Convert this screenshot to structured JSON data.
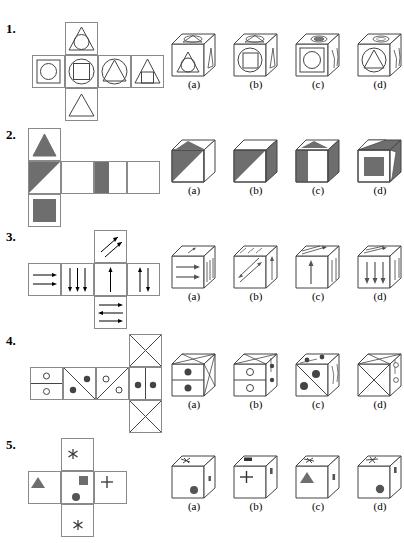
{
  "worksheet": {
    "title": "Cube Folding Spatial Reasoning Worksheet",
    "problem_count": 5
  },
  "colors": {
    "line": "#444444",
    "net_border": "#8a8a8a",
    "fill_gray": "#6e6e6e",
    "white": "#ffffff",
    "text": "#000000"
  },
  "option_labels": [
    "(a)",
    "(b)",
    "(c)",
    "(d)"
  ],
  "problems": [
    {
      "number": "1.",
      "net_description": "Cross net with a center row of four squares plus one square above and one below the second cell",
      "net_faces": [
        {
          "position": "top",
          "symbol": "triangle-with-inscribed-circle"
        },
        {
          "position": "row-1",
          "symbol": "square-with-circle"
        },
        {
          "position": "row-2",
          "symbol": "circle-with-square"
        },
        {
          "position": "row-3",
          "symbol": "circle-with-triangle"
        },
        {
          "position": "row-4",
          "symbol": "triangle-with-square"
        },
        {
          "position": "bottom",
          "symbol": "triangle-outline"
        }
      ],
      "options": [
        {
          "label": "(a)",
          "front": "triangle-with-circle"
        },
        {
          "label": "(b)",
          "front": "circle-with-square"
        },
        {
          "label": "(c)",
          "front": "square-with-circle"
        },
        {
          "label": "(d)",
          "front": "circle-with-triangle"
        }
      ]
    },
    {
      "number": "2.",
      "net_description": "Vertical strip of three squares on the left joined to a horizontal row of four squares",
      "net_faces": [
        {
          "position": "top",
          "symbol": "gray-triangle-up"
        },
        {
          "position": "row-1",
          "symbol": "gray-diagonal-lower-left"
        },
        {
          "position": "bottom",
          "symbol": "gray-square"
        },
        {
          "position": "row-2",
          "symbol": "blank"
        },
        {
          "position": "row-3",
          "symbol": "gray-vertical-band"
        },
        {
          "position": "row-4",
          "symbol": "blank"
        }
      ],
      "options": [
        {
          "label": "(a)",
          "front": "gray-diagonal-lower-left"
        },
        {
          "label": "(b)",
          "front": "gray-diagonal-upper-left"
        },
        {
          "label": "(c)",
          "front": "gray-vertical-band-left"
        },
        {
          "label": "(d)",
          "front": "gray-square-center"
        }
      ]
    },
    {
      "number": "3.",
      "net_description": "Row of four squares with one square above and one below the third cell",
      "net_faces": [
        {
          "position": "top",
          "symbol": "two-diagonal-arrows-up-right"
        },
        {
          "position": "row-1",
          "symbol": "two-arrows-right"
        },
        {
          "position": "row-2",
          "symbol": "three-arrows-down"
        },
        {
          "position": "row-3",
          "symbol": "one-arrow-up"
        },
        {
          "position": "row-4",
          "symbol": "arrow-up-and-arrow-down"
        },
        {
          "position": "bottom",
          "symbol": "three-arrows-right-left-right"
        }
      ],
      "options": [
        {
          "label": "(a)",
          "front": "two-arrows-right"
        },
        {
          "label": "(b)",
          "front": "two-diagonal-arrows"
        },
        {
          "label": "(c)",
          "front": "one-arrow-up"
        },
        {
          "label": "(d)",
          "front": "three-arrows-down"
        }
      ]
    },
    {
      "number": "4.",
      "net_description": "Row of four squares with one square above and one below the fourth cell",
      "net_faces": [
        {
          "position": "top",
          "symbol": "square-with-x-cross"
        },
        {
          "position": "row-1",
          "symbol": "horizontal-split-two-open-dots"
        },
        {
          "position": "row-2",
          "symbol": "diagonal-with-two-filled-dots"
        },
        {
          "position": "row-3",
          "symbol": "diagonal-with-two-open-dots"
        },
        {
          "position": "row-4",
          "symbol": "vertical-split-two-filled-dots"
        },
        {
          "position": "bottom",
          "symbol": "square-with-x-cross"
        }
      ],
      "options": [
        {
          "label": "(a)",
          "front": "horizontal-split-two-filled-dots"
        },
        {
          "label": "(b)",
          "front": "horizontal-split-two-open-dots"
        },
        {
          "label": "(c)",
          "front": "diagonal-with-two-filled-dots"
        },
        {
          "label": "(d)",
          "front": "square-with-x-cross"
        }
      ]
    },
    {
      "number": "5.",
      "net_description": "Row of three squares with one square above and one below the second cell",
      "net_faces": [
        {
          "position": "top",
          "symbol": "asterisk"
        },
        {
          "position": "row-1",
          "symbol": "gray-triangle-up-small"
        },
        {
          "position": "row-2",
          "symbol": "gray-square-small-and-filled-circle"
        },
        {
          "position": "row-3",
          "symbol": "plus-sign"
        },
        {
          "position": "bottom",
          "symbol": "asterisk"
        }
      ],
      "options": [
        {
          "label": "(a)",
          "front": "filled-circle"
        },
        {
          "label": "(b)",
          "front": "plus-sign"
        },
        {
          "label": "(c)",
          "front": "gray-triangle-up"
        },
        {
          "label": "(d)",
          "front": "filled-circle"
        }
      ]
    }
  ]
}
